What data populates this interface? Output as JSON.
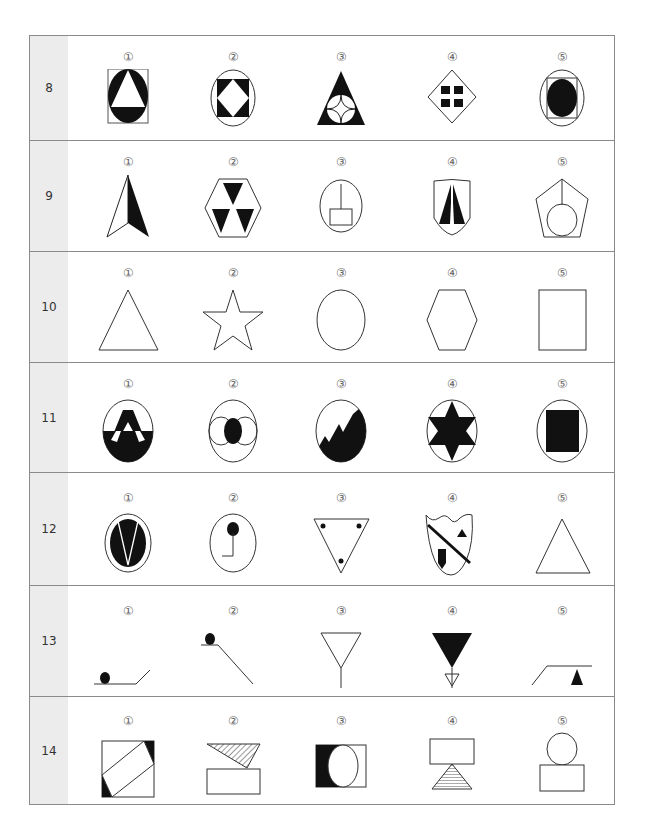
{
  "page": {
    "footer_text": ""
  },
  "option_markers": [
    "①",
    "②",
    "③",
    "④",
    "⑤"
  ],
  "rows": [
    {
      "number": "8",
      "options": [
        {
          "marker": "①",
          "figure": "circle-in-square-with-white-triangle"
        },
        {
          "marker": "②",
          "figure": "square-in-circle-with-white-diamond"
        },
        {
          "marker": "③",
          "figure": "black-triangle-with-four-point-star-circle"
        },
        {
          "marker": "④",
          "figure": "diamond-with-four-black-rectangles"
        },
        {
          "marker": "⑤",
          "figure": "black-circle-in-square-in-circle"
        }
      ]
    },
    {
      "number": "9",
      "options": [
        {
          "marker": "①",
          "figure": "half-black-arrowhead"
        },
        {
          "marker": "②",
          "figure": "hexagon-with-three-black-triangles"
        },
        {
          "marker": "③",
          "figure": "circle-with-rectangle-and-stem"
        },
        {
          "marker": "④",
          "figure": "shield-with-two-black-spikes"
        },
        {
          "marker": "⑤",
          "figure": "pentagon-with-circle-and-stem"
        }
      ]
    },
    {
      "number": "10",
      "options": [
        {
          "marker": "①",
          "figure": "triangle"
        },
        {
          "marker": "②",
          "figure": "star"
        },
        {
          "marker": "③",
          "figure": "circle"
        },
        {
          "marker": "④",
          "figure": "hexagon"
        },
        {
          "marker": "⑤",
          "figure": "square"
        }
      ]
    },
    {
      "number": "11",
      "options": [
        {
          "marker": "①",
          "figure": "circle-with-letter-a-half-black"
        },
        {
          "marker": "②",
          "figure": "circle-with-three-overlapping-circles"
        },
        {
          "marker": "③",
          "figure": "circle-with-black-mountain"
        },
        {
          "marker": "④",
          "figure": "circle-with-black-six-point-star"
        },
        {
          "marker": "⑤",
          "figure": "circle-with-black-square"
        }
      ]
    },
    {
      "number": "12",
      "options": [
        {
          "marker": "①",
          "figure": "black-circle-with-v-in-ring"
        },
        {
          "marker": "②",
          "figure": "circle-with-pin-symbol"
        },
        {
          "marker": "③",
          "figure": "inverted-triangle-with-three-dots"
        },
        {
          "marker": "④",
          "figure": "shield-with-diagonal-bar"
        },
        {
          "marker": "⑤",
          "figure": "triangle"
        }
      ]
    },
    {
      "number": "13",
      "options": [
        {
          "marker": "①",
          "figure": "ball-on-flat-then-slope"
        },
        {
          "marker": "②",
          "figure": "ball-on-ledge-down-slope"
        },
        {
          "marker": "③",
          "figure": "inverted-triangle-on-stem"
        },
        {
          "marker": "④",
          "figure": "black-inverted-triangle-over-small-triangle"
        },
        {
          "marker": "⑤",
          "figure": "slope-with-black-triangle"
        }
      ]
    },
    {
      "number": "14",
      "options": [
        {
          "marker": "①",
          "figure": "square-with-rotated-rectangle"
        },
        {
          "marker": "②",
          "figure": "hatched-triangle-over-rectangle"
        },
        {
          "marker": "③",
          "figure": "rectangle-with-circle-black-left"
        },
        {
          "marker": "④",
          "figure": "rectangle-on-hatched-triangle"
        },
        {
          "marker": "⑤",
          "figure": "circle-on-rectangle"
        }
      ]
    }
  ]
}
